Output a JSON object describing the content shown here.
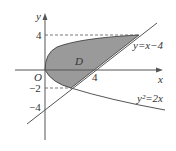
{
  "diagram": {
    "axes": {
      "x_label": "x",
      "y_label": "y",
      "origin_label": "O"
    },
    "ticks": {
      "y_pos": "4",
      "y_neg2": "−2",
      "y_neg4": "−4",
      "x_pos": "4"
    },
    "region_label": "D",
    "curves": {
      "line": "y=x−4",
      "parabola": "y²=2x"
    },
    "colors": {
      "region_fill": "#9a9a9a",
      "stroke": "#333333"
    }
  }
}
